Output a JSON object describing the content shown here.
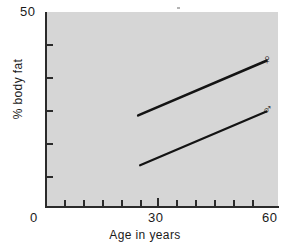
{
  "chart_data": {
    "type": "line",
    "title": "",
    "xlabel": "Age in years",
    "ylabel": "% body fat",
    "xlim": [
      0,
      60
    ],
    "ylim": [
      0,
      50
    ],
    "grid": false,
    "legend_position": "inline-right-end",
    "x_ticks": [
      0,
      30,
      60
    ],
    "x_tick_labels": [
      "0",
      "30",
      "60"
    ],
    "x_minor_ticks": [
      5,
      10,
      15,
      20,
      25,
      35,
      40,
      45,
      50,
      55
    ],
    "y_ticks": [
      0,
      50
    ],
    "y_tick_labels": [
      "0",
      "50"
    ],
    "y_minor_ticks": [
      8.3,
      16.7,
      25,
      33.3,
      41.7
    ],
    "series": [
      {
        "name": "female",
        "symbol": "♀",
        "x": [
          24,
          57
        ],
        "y": [
          23.5,
          37.5
        ]
      },
      {
        "name": "male",
        "symbol": "♂",
        "x": [
          24.5,
          57
        ],
        "y": [
          10.7,
          24.5
        ]
      }
    ]
  },
  "axes": {
    "y_top_label": "50",
    "origin_label": "0",
    "x_mid_label": "30",
    "x_max_label": "60",
    "x_axis_title": "Age in years",
    "y_axis_title": "% body fat"
  },
  "legend": {
    "female_symbol": "♀",
    "male_symbol": "♂"
  },
  "colors": {
    "plot_background": "#d6d6d6",
    "axis": "#2b2b2b",
    "line": "#141414",
    "page_background": "#ffffff"
  }
}
